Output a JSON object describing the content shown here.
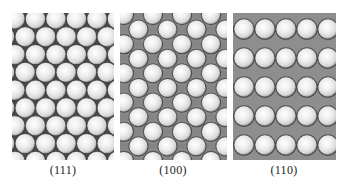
{
  "figure": {
    "panels": [
      {
        "id": "fcc-111",
        "label": "(111)",
        "arrangement": "hexagonal close-packed",
        "x": 12,
        "y": 13,
        "width": 102,
        "height": 147,
        "sphere_radius": 10.2,
        "col_spacing": 20.5,
        "row_spacing": 17.8,
        "rows": 9,
        "cols": 6,
        "row_offset": 10.2,
        "background": "#4a4a4a"
      },
      {
        "id": "fcc-100",
        "label": "(100)",
        "arrangement": "centered square",
        "x": 120,
        "y": 13,
        "width": 107,
        "height": 147,
        "sphere_radius": 9.6,
        "col_spacing": 29,
        "row_spacing": 14.6,
        "rows": 11,
        "cols": 5,
        "row_offset": 14.5,
        "background": "#8a8a8a"
      },
      {
        "id": "fcc-110",
        "label": "(110)",
        "arrangement": "rectangular rows with second layer",
        "x": 233,
        "y": 13,
        "width": 103,
        "height": 147,
        "sphere_radius": 10.2,
        "col_spacing": 21,
        "row_spacing": 29,
        "rows": 6,
        "cols": 6,
        "row_offset": 0,
        "background": "#8e8e8e"
      }
    ],
    "colors": {
      "sphere_highlight": "#ffffff",
      "sphere_mid": "#d6d6d6",
      "sphere_edge": "#7a7a7a",
      "outline": "#3a3a3a",
      "label_text": "#222222"
    }
  }
}
